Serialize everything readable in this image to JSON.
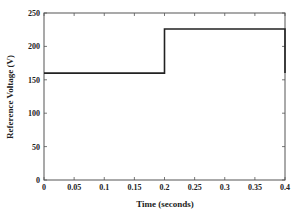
{
  "chart_data": {
    "type": "line",
    "title": "",
    "xlabel": "Time (seconds)",
    "ylabel": "Reference Voltage (V)",
    "xlim": [
      0,
      0.4
    ],
    "ylim": [
      0,
      250
    ],
    "xticks": [
      0,
      0.05,
      0.1,
      0.15,
      0.2,
      0.25,
      0.3,
      0.35,
      0.4
    ],
    "xtick_labels": [
      "0",
      "0.05",
      "0.1",
      "0.15",
      "0.2",
      "0.25",
      "0.3",
      "0.35",
      "0.4"
    ],
    "yticks": [
      0,
      50,
      100,
      150,
      200,
      250
    ],
    "ytick_labels": [
      "0",
      "50",
      "100",
      "150",
      "200",
      "250"
    ],
    "grid": false,
    "legend": null,
    "series": [
      {
        "name": "Reference Voltage",
        "color": "#222222",
        "x": [
          0,
          0.2,
          0.2,
          0.4,
          0.4
        ],
        "y": [
          160,
          160,
          226,
          226,
          160
        ]
      }
    ]
  }
}
